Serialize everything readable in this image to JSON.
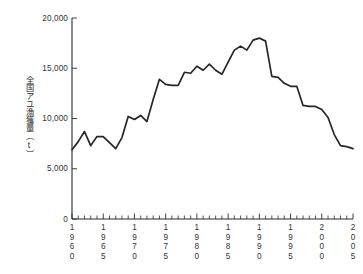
{
  "chart_data": {
    "type": "line",
    "title": "",
    "subtitle": "",
    "xlabel": "",
    "ylabel": "全国アユ漁獲量（t）",
    "ylabel_chars": "全国アユ漁獲量（t）",
    "xlim": [
      1960,
      2005
    ],
    "ylim": [
      0,
      20000
    ],
    "y_ticks": [
      0,
      5000,
      10000,
      15000,
      20000
    ],
    "y_tick_labels": [
      "0",
      "5,000",
      "10,000",
      "15,000",
      "20,000"
    ],
    "x_ticks": [
      1960,
      1965,
      1970,
      1975,
      1980,
      1985,
      1990,
      1995,
      2000,
      2005
    ],
    "x_tick_labels": [
      "1960",
      "1965",
      "1970",
      "1975",
      "1980",
      "1985",
      "1990",
      "1995",
      "2000",
      "2005"
    ],
    "x_minor_tick_step": 1,
    "grid": false,
    "legend": false,
    "legend_position": "none",
    "line_color": "#262626",
    "axis_color": "#2b2b2b",
    "background_color": "#ffffff",
    "units": "t",
    "x": [
      1960,
      1961,
      1962,
      1963,
      1964,
      1965,
      1966,
      1967,
      1968,
      1969,
      1970,
      1971,
      1972,
      1973,
      1974,
      1975,
      1976,
      1977,
      1978,
      1979,
      1980,
      1981,
      1982,
      1983,
      1984,
      1985,
      1986,
      1987,
      1988,
      1989,
      1990,
      1991,
      1992,
      1993,
      1994,
      1995,
      1996,
      1997,
      1998,
      1999,
      2000,
      2001,
      2002,
      2003,
      2004,
      2005
    ],
    "values": [
      6900,
      7700,
      8700,
      7300,
      8200,
      8200,
      7600,
      7000,
      8100,
      10200,
      9900,
      10300,
      9700,
      11900,
      13900,
      13400,
      13300,
      13300,
      14600,
      14500,
      15200,
      14800,
      15400,
      14800,
      14400,
      15600,
      16800,
      17200,
      16800,
      17800,
      18000,
      17700,
      14200,
      14100,
      13500,
      13200,
      13200,
      11300,
      11200,
      11200,
      10900,
      10100,
      8400,
      7300,
      7200,
      7000
    ],
    "series": [
      {
        "name": "全国アユ漁獲量",
        "values": [
          6900,
          7700,
          8700,
          7300,
          8200,
          8200,
          7600,
          7000,
          8100,
          10200,
          9900,
          10300,
          9700,
          11900,
          13900,
          13400,
          13300,
          13300,
          14600,
          14500,
          15200,
          14800,
          15400,
          14800,
          14400,
          15600,
          16800,
          17200,
          16800,
          17800,
          18000,
          17700,
          14200,
          14100,
          13500,
          13200,
          13200,
          11300,
          11200,
          11200,
          10900,
          10100,
          8400,
          7300,
          7200,
          7000
        ]
      }
    ],
    "annotations": []
  },
  "plot": {
    "x_axis_name": "year-axis",
    "y_axis_name": "catch-axis"
  }
}
